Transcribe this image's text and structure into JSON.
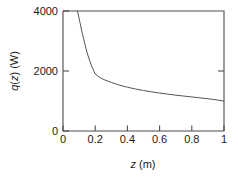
{
  "chart_data": {
    "type": "line",
    "title": "",
    "xlabel": "z (m)",
    "ylabel": "q(z) (W)",
    "xlim": [
      0,
      1
    ],
    "ylim": [
      0,
      4000
    ],
    "xticks": [
      "0",
      "0.2",
      "0.4",
      "0.6",
      "0.8",
      "1"
    ],
    "xtick_values": [
      0,
      0.2,
      0.4,
      0.6,
      0.8,
      1
    ],
    "yticks": [
      "0",
      "2000",
      "4000"
    ],
    "ytick_values": [
      0,
      2000,
      4000
    ],
    "grid": false,
    "legend": false,
    "legend_position": "none",
    "line_color": "#555555",
    "axis_color": "#4d4d4d",
    "series": [
      {
        "name": "q(z)",
        "x": [
          0.09,
          0.12,
          0.15,
          0.175,
          0.2,
          0.23,
          0.26,
          0.3,
          0.35,
          0.4,
          0.45,
          0.5,
          0.55,
          0.6,
          0.65,
          0.7,
          0.75,
          0.8,
          0.85,
          0.9,
          0.95,
          1.0
        ],
        "values": [
          4000,
          3250,
          2600,
          2200,
          1900,
          1780,
          1700,
          1620,
          1530,
          1460,
          1400,
          1350,
          1305,
          1265,
          1230,
          1195,
          1165,
          1135,
          1105,
          1075,
          1040,
          1000
        ]
      }
    ],
    "annotations": [
      {
        "text": "kink at z = 0.2 m, q = 1900 W",
        "x": 0.2,
        "y": 1900
      }
    ]
  },
  "ylabel_parts": {
    "symbol": "q",
    "arg_open": "(",
    "arg": "z",
    "arg_close": ")",
    "unit": " (W)"
  },
  "xlabel_parts": {
    "symbol": "z",
    "unit": " (m)"
  }
}
